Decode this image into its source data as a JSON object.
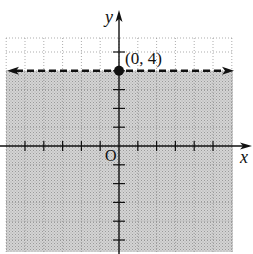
{
  "chart_data": {
    "type": "line",
    "title": "",
    "xlabel": "x",
    "ylabel": "y",
    "xlim": [
      -6,
      6
    ],
    "ylim": [
      -5.7,
      5.8
    ],
    "grid": true,
    "boundary": {
      "equation": "y = 4",
      "style": "dashed",
      "arrows": "both",
      "y": 4
    },
    "shaded_region": "below boundary (y < 4)",
    "points": [
      {
        "x": 0,
        "y": 4,
        "label": "(0, 4)"
      }
    ],
    "origin_label": "O",
    "colors": {
      "shade": "#c8c8c8",
      "grid": "#8a8a8a",
      "axis": "#111111",
      "boundary": "#111111"
    }
  }
}
